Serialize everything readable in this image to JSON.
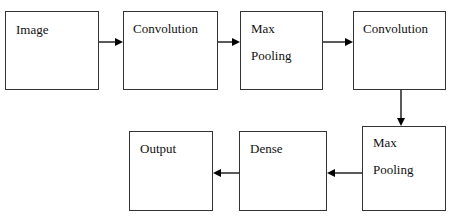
{
  "diagram": {
    "type": "flowchart",
    "nodes": [
      {
        "id": "image",
        "lines": [
          "Image"
        ]
      },
      {
        "id": "conv1",
        "lines": [
          "Convolution"
        ]
      },
      {
        "id": "pool1",
        "lines": [
          "Max",
          "Pooling"
        ]
      },
      {
        "id": "conv2",
        "lines": [
          "Convolution"
        ]
      },
      {
        "id": "pool2",
        "lines": [
          "Max",
          "Pooling"
        ]
      },
      {
        "id": "dense",
        "lines": [
          "Dense"
        ]
      },
      {
        "id": "output",
        "lines": [
          "Output"
        ]
      }
    ],
    "edges": [
      [
        "image",
        "conv1"
      ],
      [
        "conv1",
        "pool1"
      ],
      [
        "pool1",
        "conv2"
      ],
      [
        "conv2",
        "pool2"
      ],
      [
        "pool2",
        "dense"
      ],
      [
        "dense",
        "output"
      ]
    ],
    "colors": {
      "stroke": "#333333",
      "arrow": "#000000",
      "background": "#ffffff"
    }
  }
}
